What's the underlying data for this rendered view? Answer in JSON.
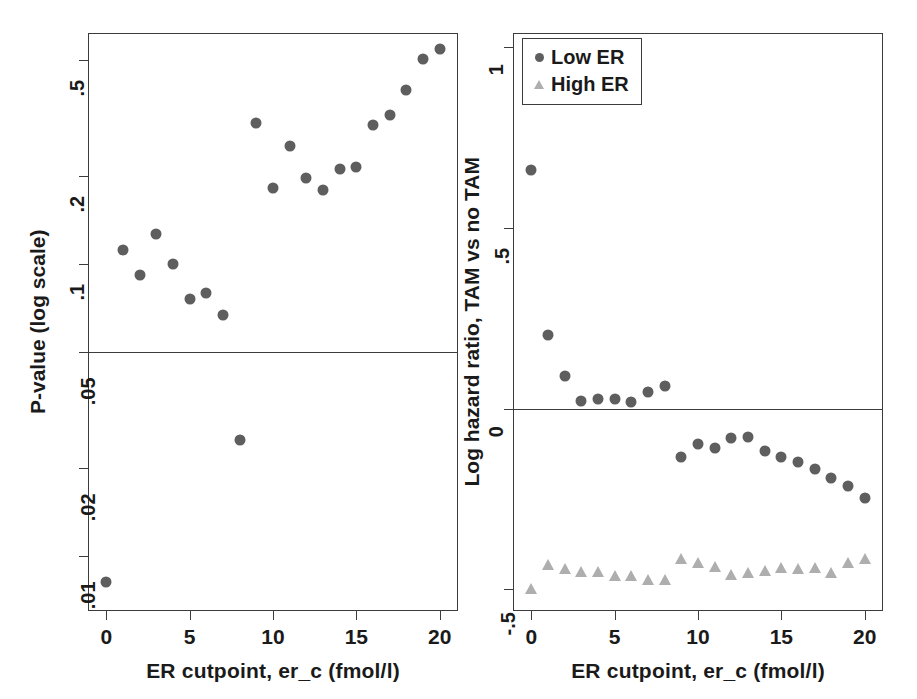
{
  "figure": {
    "width": 917,
    "height": 699,
    "background": "#ffffff",
    "marker_colors": {
      "low_er": "#5e5e5e",
      "high_er": "#aeaeae",
      "axis": "#3c3c3c"
    }
  },
  "chart_data": [
    {
      "id": "left-panel",
      "type": "scatter",
      "title": "",
      "xlabel": "ER cutpoint, er_c (fmol/l)",
      "ylabel": "P-value (log scale)",
      "yscale": "log",
      "xlim": [
        -1.1,
        21.1
      ],
      "ylim": [
        0.0065,
        0.62
      ],
      "xticks": [
        0,
        5,
        10,
        15,
        20
      ],
      "xticklabels": [
        "0",
        "5",
        "10",
        "15",
        "20"
      ],
      "yticks": [
        0.5,
        0.2,
        0.1,
        0.05,
        0.02,
        0.01
      ],
      "yticklabels": [
        ".5",
        ".2",
        ".1",
        ".05",
        ".02",
        ".01"
      ],
      "grid": false,
      "reference_lines": [
        {
          "axis": "y",
          "value": 0.05,
          "label": ""
        }
      ],
      "series": [
        {
          "name": "P-value",
          "marker": "circle",
          "color": "#5e5e5e",
          "x": [
            0,
            1,
            2,
            3,
            4,
            5,
            6,
            7,
            8,
            9,
            10,
            11,
            12,
            13,
            14,
            15,
            16,
            17,
            18,
            19,
            20
          ],
          "y": [
            0.0082,
            0.112,
            0.092,
            0.127,
            0.1,
            0.076,
            0.08,
            0.067,
            0.025,
            0.305,
            0.183,
            0.255,
            0.197,
            0.18,
            0.212,
            0.216,
            0.3,
            0.325,
            0.395,
            0.505,
            0.545
          ]
        }
      ]
    },
    {
      "id": "right-panel",
      "type": "scatter",
      "title": "",
      "xlabel": "ER cutpoint, er_c (fmol/l)",
      "ylabel": "Log hazard ratio, TAM vs no TAM",
      "yscale": "linear",
      "xlim": [
        -1.1,
        21.1
      ],
      "ylim": [
        -0.56,
        1.04
      ],
      "xticks": [
        0,
        5,
        10,
        15,
        20
      ],
      "xticklabels": [
        "0",
        "5",
        "10",
        "15",
        "20"
      ],
      "yticks": [
        1,
        0.5,
        0,
        -0.5
      ],
      "yticklabels": [
        "1",
        ".5",
        "0",
        "-.5"
      ],
      "grid": false,
      "reference_lines": [
        {
          "axis": "y",
          "value": 0,
          "label": ""
        }
      ],
      "legend": {
        "position": "top-left",
        "entries": [
          {
            "label": "Low ER",
            "marker": "circle",
            "color": "#5e5e5e"
          },
          {
            "label": "High ER",
            "marker": "triangle",
            "color": "#aeaeae"
          }
        ]
      },
      "series": [
        {
          "name": "Low ER",
          "marker": "circle",
          "color": "#5e5e5e",
          "x": [
            0,
            1,
            2,
            3,
            4,
            5,
            6,
            7,
            8,
            9,
            10,
            11,
            12,
            13,
            14,
            15,
            16,
            17,
            18,
            19,
            20
          ],
          "y": [
            0.66,
            0.205,
            0.09,
            0.022,
            0.028,
            0.026,
            0.018,
            0.047,
            0.064,
            -0.133,
            -0.098,
            -0.108,
            -0.08,
            -0.079,
            -0.116,
            -0.134,
            -0.148,
            -0.167,
            -0.191,
            -0.213,
            -0.246
          ]
        },
        {
          "name": "High ER",
          "marker": "triangle",
          "color": "#aeaeae",
          "x": [
            0,
            1,
            2,
            3,
            4,
            5,
            6,
            7,
            8,
            9,
            10,
            11,
            12,
            13,
            14,
            15,
            16,
            17,
            18,
            19,
            20
          ],
          "y": [
            -0.5,
            -0.432,
            -0.443,
            -0.453,
            -0.452,
            -0.462,
            -0.462,
            -0.475,
            -0.473,
            -0.415,
            -0.427,
            -0.437,
            -0.459,
            -0.456,
            -0.448,
            -0.442,
            -0.444,
            -0.441,
            -0.455,
            -0.428,
            -0.416,
            -0.412
          ]
        }
      ]
    }
  ],
  "left_panel": {
    "y_axis_title": "P-value (log scale)",
    "x_axis_title": "ER cutpoint, er_c (fmol/l)",
    "y_tick_labels": [
      ".5",
      ".2",
      ".1",
      ".05",
      ".02",
      ".01"
    ],
    "x_tick_labels": [
      "0",
      "5",
      "10",
      "15",
      "20"
    ]
  },
  "right_panel": {
    "y_axis_title": "Log hazard ratio, TAM vs no TAM",
    "x_axis_title": "ER cutpoint, er_c (fmol/l)",
    "y_tick_labels": [
      "1",
      ".5",
      "0",
      "-.5"
    ],
    "x_tick_labels": [
      "0",
      "5",
      "10",
      "15",
      "20"
    ],
    "legend": {
      "low_er_label": "Low ER",
      "high_er_label": "High ER"
    }
  }
}
